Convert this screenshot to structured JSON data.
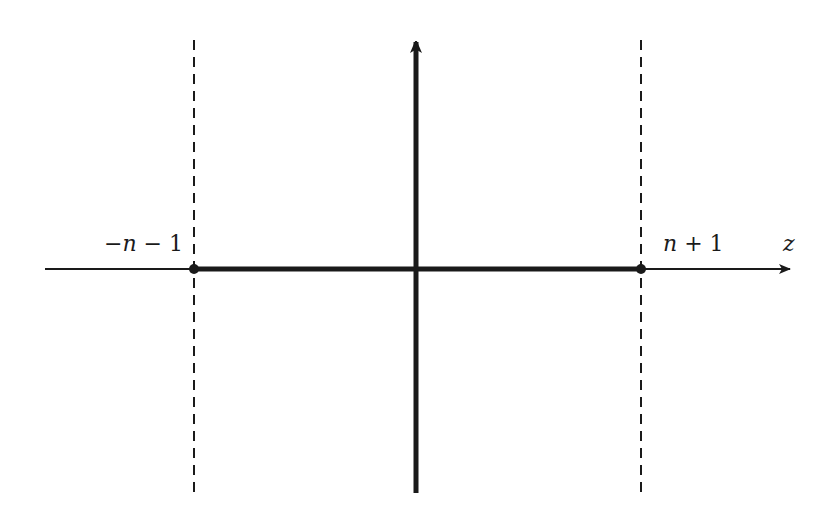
{
  "diagram": {
    "labels": {
      "left_point": {
        "minus": "−",
        "var": "n",
        "rest": " − 1"
      },
      "right_point": {
        "var": "n",
        "rest": " + 1"
      },
      "axis": "z"
    },
    "colors": {
      "line": "#1a1a1a",
      "background": "#ffffff"
    }
  }
}
